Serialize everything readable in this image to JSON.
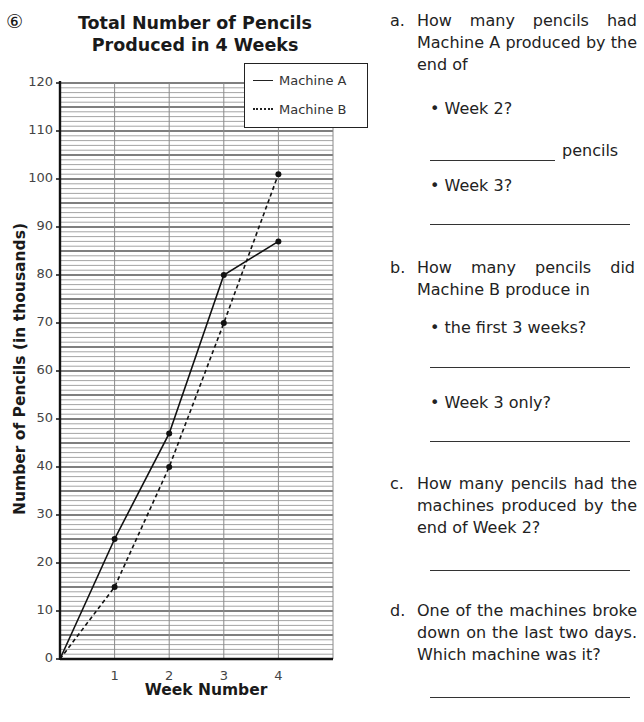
{
  "question_number": "⑥",
  "chart_data": {
    "type": "line",
    "title": "Total Number of Pencils Produced in 4 Weeks",
    "title_lines": [
      "Total Number of Pencils",
      "Produced in 4 Weeks"
    ],
    "xlabel": "Week Number",
    "ylabel": "Number of Pencils (in thousands)",
    "x": [
      0,
      1,
      2,
      3,
      4
    ],
    "x_tick_labels": [
      "1",
      "2",
      "3",
      "4"
    ],
    "y_tick_labels": [
      "0",
      "10",
      "20",
      "30",
      "40",
      "50",
      "60",
      "70",
      "80",
      "90",
      "100",
      "110",
      "120"
    ],
    "ylim": [
      0,
      120
    ],
    "xlim": [
      0,
      5
    ],
    "grid": {
      "minor_step": 1,
      "major_step": 5,
      "vertical_step": 1
    },
    "legend_position": "top-right",
    "series": [
      {
        "name": "Machine A",
        "style": "solid",
        "values": [
          0,
          25,
          47,
          80,
          87
        ]
      },
      {
        "name": "Machine B",
        "style": "dashed",
        "values": [
          0,
          15,
          40,
          70,
          101
        ]
      }
    ]
  },
  "questions": {
    "a": {
      "label": "a.",
      "text": "How many pencils had Machine A produced by the end of",
      "items": [
        {
          "prompt": "• Week 2?",
          "unit": "pencils"
        },
        {
          "prompt": "• Week 3?"
        }
      ]
    },
    "b": {
      "label": "b.",
      "text": "How many pencils did Machine B produce in",
      "items": [
        {
          "prompt": "• the first 3 weeks?"
        },
        {
          "prompt": "• Week 3 only?"
        }
      ]
    },
    "c": {
      "label": "c.",
      "text": "How many pencils had the machines produced by the end of Week 2?"
    },
    "d": {
      "label": "d.",
      "text": "One of the machines broke down on the last two days. Which machine was it?"
    }
  }
}
